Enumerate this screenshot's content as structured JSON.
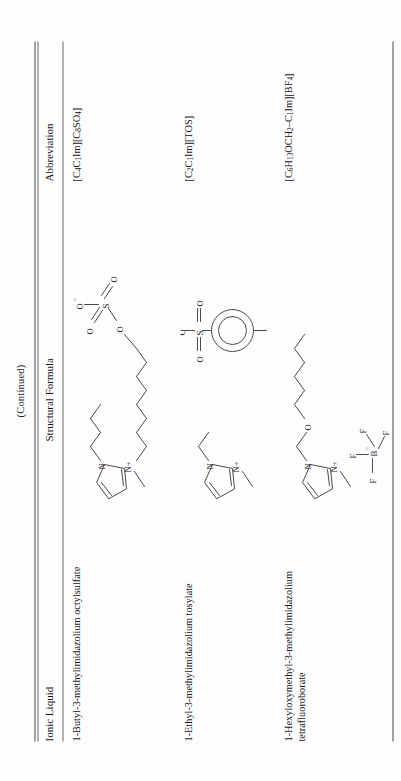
{
  "page": {
    "continued_note": "(Continued)",
    "orientation": "rotated-90-ccw",
    "rule_color": "#4a4a4a"
  },
  "table": {
    "headers": {
      "ionic_liquid": "Ionic Liquid",
      "structural_formula": "Structural Formula",
      "abbreviation": "Abbreviation"
    },
    "rows": [
      {
        "name": "1-Butyl-3-methylimidazolium octylsulfate",
        "abbreviation": "[C4C1Im][C8SO4]",
        "abbreviation_html": "[C<sub>4</sub>C<sub>1</sub>Im][C<sub>8</sub>SO<sub>4</sub>]",
        "structure_name": "butyl-methylimidazolium-octylsulfate-structure",
        "cation_labels": [
          "N",
          "N+"
        ],
        "anion_labels": [
          "O",
          "S",
          "O",
          "O",
          "O"
        ]
      },
      {
        "name": "1-Ethyl-3-methylimidazolium tosylate",
        "abbreviation": "[C2C1Im][TOS]",
        "abbreviation_html": "[C<sub>2</sub>C<sub>1</sub>Im][TOS]",
        "structure_name": "ethyl-methylimidazolium-tosylate-structure",
        "cation_labels": [
          "N",
          "N+"
        ],
        "anion_labels": [
          "O",
          "S",
          "O",
          "O"
        ]
      },
      {
        "name": "1-Hexyloxymethyl-3-methylimidazolium tetrafluoroborate",
        "abbreviation": "[C6H13OCH2–C1Im][BF4]",
        "abbreviation_html": "[C<sub>6</sub>H<sub>13</sub>OCH<sub>2</sub>&#8211;C<sub>1</sub>Im][BF<sub>4</sub>]",
        "structure_name": "hexyloxymethyl-methylimidazolium-tetrafluoroborate-structure",
        "cation_labels": [
          "N",
          "N+",
          "O"
        ],
        "anion_labels": [
          "F",
          "F",
          "F",
          "F",
          "B"
        ]
      }
    ]
  }
}
